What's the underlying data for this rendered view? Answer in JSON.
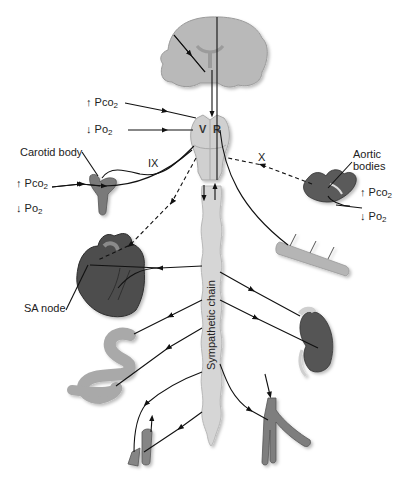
{
  "diagram": {
    "title": "",
    "nodes": {
      "brain": {
        "label": "Cerebrum"
      },
      "medulla": {
        "label": "Medulla",
        "left_center": "V",
        "right_center": "R"
      },
      "sympathetic_chain": {
        "label": "Sympathetic chain"
      },
      "carotid_body": {
        "label": "Carotid body"
      },
      "aortic_bodies": {
        "label_line1": "Aortic",
        "label_line2": "bodies"
      },
      "heart": {
        "label": "Heart"
      },
      "sa_node": {
        "label": "SA node"
      },
      "intestine": {
        "label": "Intestine"
      },
      "kidney": {
        "label": "Kidney"
      },
      "skeletal_muscle": {
        "label": "Muscle"
      },
      "blood_vessel_left": {
        "label": "Blood vessel"
      },
      "blood_vessel_right": {
        "label": "Blood vessel"
      }
    },
    "nerves": {
      "glossopharyngeal": "IX",
      "vagus": "X"
    },
    "stimuli": {
      "central": {
        "pco2": "↑ Pco",
        "po2": "↓ Po",
        "sub": "2"
      },
      "carotid": {
        "pco2": "↑ Pco",
        "po2": "↓ Po",
        "sub": "2"
      },
      "aortic": {
        "pco2": "↑ Pco",
        "po2": "↓ Po",
        "sub": "2"
      }
    },
    "colors": {
      "brain": "#b8b8b8",
      "medulla": "#d4d4d4",
      "chain": "#d8d8d8",
      "organ_dark": "#4a4a4a",
      "organ_light": "#a8a8a8",
      "line": "#111111"
    }
  }
}
